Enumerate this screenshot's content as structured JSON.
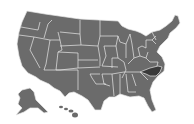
{
  "map": {
    "title": "United States",
    "base_color": "#6b6b6b",
    "border_color": "#e8e8e8",
    "highlight_color": "#3a3a3a",
    "highlighted_state": "North Carolina",
    "insets": [
      "Alaska",
      "Hawaii"
    ]
  }
}
